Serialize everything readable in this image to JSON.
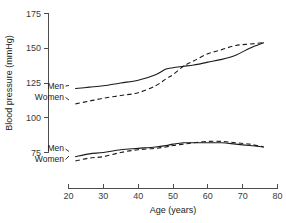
{
  "chart_data": {
    "type": "line",
    "title": "",
    "xlabel": "Age (years)",
    "ylabel": "Blood pressure (mmHg)",
    "xlim": [
      20,
      80
    ],
    "ylim": [
      75,
      175
    ],
    "xticks": [
      20,
      30,
      40,
      50,
      60,
      70,
      80
    ],
    "yticks": [
      75,
      100,
      125,
      150,
      175
    ],
    "grid": false,
    "legend_position": "inline-labels-left",
    "series": [
      {
        "name": "Men",
        "group": "systolic",
        "style": "solid",
        "color": "#1a1a1a",
        "x": [
          22,
          26,
          30,
          35,
          40,
          45,
          48,
          50,
          53,
          56,
          60,
          64,
          68,
          72,
          76
        ],
        "values": [
          121,
          122,
          123,
          125,
          127,
          131,
          135,
          136,
          137,
          138,
          140,
          142,
          145,
          150,
          154
        ]
      },
      {
        "name": "Women",
        "group": "systolic",
        "style": "dashed",
        "color": "#1a1a1a",
        "x": [
          22,
          26,
          30,
          35,
          40,
          45,
          48,
          50,
          53,
          56,
          60,
          64,
          68,
          72,
          76
        ],
        "values": [
          110,
          112,
          114,
          116,
          118,
          123,
          128,
          131,
          137,
          141,
          146,
          149,
          152,
          153,
          154
        ]
      },
      {
        "name": "Men",
        "group": "diastolic",
        "style": "solid",
        "color": "#1a1a1a",
        "x": [
          22,
          26,
          30,
          35,
          40,
          45,
          48,
          50,
          53,
          56,
          60,
          64,
          68,
          72,
          76
        ],
        "values": [
          72,
          74,
          75,
          77,
          78,
          79,
          80,
          81,
          82,
          82,
          82,
          82,
          81,
          80,
          79
        ]
      },
      {
        "name": "Women",
        "group": "diastolic",
        "style": "dashed",
        "color": "#1a1a1a",
        "x": [
          22,
          26,
          30,
          35,
          40,
          45,
          48,
          50,
          53,
          56,
          60,
          64,
          68,
          72,
          76
        ],
        "values": [
          69,
          71,
          72,
          75,
          77,
          78,
          79,
          80,
          81,
          82,
          83,
          83,
          82,
          81,
          79
        ]
      }
    ],
    "annotations": [
      {
        "text": "Men",
        "series": "systolic-men",
        "x": 22,
        "y": 121
      },
      {
        "text": "Women",
        "series": "systolic-women",
        "x": 22,
        "y": 110
      },
      {
        "text": "Men",
        "series": "diastolic-men",
        "x": 22,
        "y": 72
      },
      {
        "text": "Women",
        "series": "diastolic-women",
        "x": 22,
        "y": 69
      }
    ]
  },
  "axes": {
    "y_title": "Blood pressure (mmHg)",
    "x_title": "Age (years)",
    "y_tick_labels": [
      "175",
      "150",
      "125",
      "100",
      "75"
    ],
    "x_tick_labels": [
      "20",
      "30",
      "40",
      "50",
      "60",
      "70",
      "80"
    ]
  },
  "labels": {
    "systolic_men": "Men",
    "systolic_women": "Women",
    "diastolic_men": "Men",
    "diastolic_women": "Women"
  }
}
